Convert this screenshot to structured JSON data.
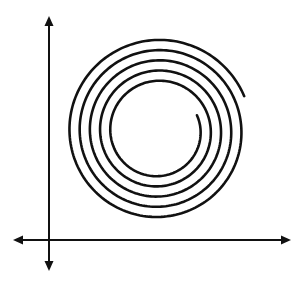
{
  "diagram": {
    "stroke_color": "#111111",
    "background": "#ffffff",
    "axes": {
      "origin": [
        49,
        240
      ],
      "y_axis": {
        "x": 49,
        "top": 16,
        "bottom": 271,
        "arrows": "both"
      },
      "x_axis": {
        "y": 240,
        "left": 13,
        "right": 291,
        "arrows": "both"
      },
      "stroke_width": 2
    },
    "spiral": {
      "center": [
        158,
        131
      ],
      "inner_radius": 42,
      "outer_radius": 93,
      "turns": 5,
      "end_angle_deg": -22,
      "stroke_width": 2.6
    }
  }
}
